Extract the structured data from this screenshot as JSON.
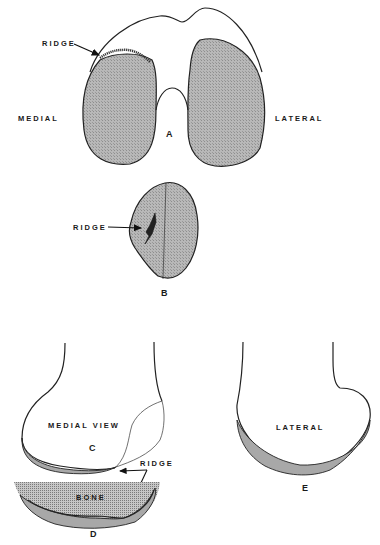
{
  "figure": {
    "panels": {
      "A": {
        "letter": "A",
        "view": "end view (distal femur, condyles)",
        "labels": {
          "ridge": "RIDGE",
          "medial": "MEDIAL",
          "lateral": "LATERAL"
        }
      },
      "B": {
        "letter": "B",
        "view": "patella articular surface",
        "labels": {
          "ridge": "RIDGE"
        }
      },
      "C": {
        "letter": "C",
        "labels": {
          "view": "MEDIAL VIEW",
          "ridge": "RIDGE"
        }
      },
      "D": {
        "letter": "D",
        "labels": {
          "bone": "BONE"
        }
      },
      "E": {
        "letter": "E",
        "labels": {
          "view": "LATERAL"
        }
      }
    },
    "colors": {
      "cartilage_fill": "#b4b4b4",
      "outline": "#222222",
      "background": "#ffffff"
    }
  }
}
